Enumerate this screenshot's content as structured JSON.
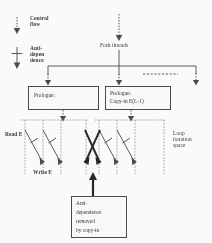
{
  "figure": {
    "legend": {
      "control_flow": "Control\nflow",
      "control_flow_icon": "dotted-down-arrow-icon",
      "anti_dependence": "Anti-\ndepen\ndence",
      "anti_dependence_icon": "barred-down-arrow-icon"
    },
    "fork": {
      "label": "Fork threads",
      "branch_count": 3,
      "ellipsis": "dashed-ellipsis"
    },
    "boxes": [
      {
        "id": "prologue-left",
        "lines": [
          "Prologue:"
        ]
      },
      {
        "id": "prologue-right",
        "lines": [
          "Prologue:",
          "Copy-in E(L-1)"
        ]
      }
    ],
    "iteration_space": {
      "label": "Loop\niteration\nspace",
      "read_label": "Read E",
      "write_label": "Write E",
      "groups": 2,
      "lines_per_group": 4,
      "anti_arrows_per_group": 2,
      "removed_marker": "bold-x-cross"
    },
    "annotation": {
      "lines": [
        "Anti-",
        "dependence",
        "removed",
        "by copy-in"
      ],
      "pointer": "up-arrow"
    },
    "colors": {
      "ink": "#3a3632",
      "dash": "#8e8882",
      "bold_ink": "#241f1c",
      "background": "#ffffff"
    }
  }
}
